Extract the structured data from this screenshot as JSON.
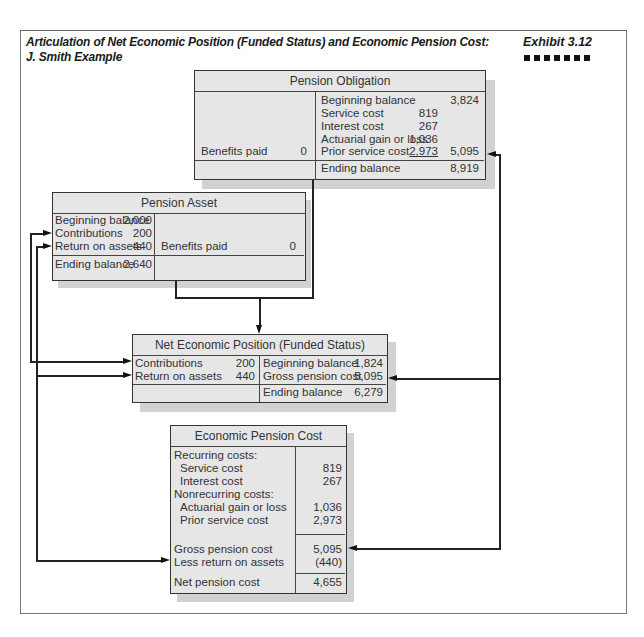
{
  "header": {
    "title_line1": "Articulation of Net Economic Position (Funded Status) and Economic Pension Cost:",
    "title_line2": "J. Smith Example",
    "exhibit": "Exhibit 3.12"
  },
  "pension_obligation": {
    "title": "Pension Obligation",
    "debit": [
      {
        "label": "Benefits paid",
        "value": "0"
      }
    ],
    "credit": [
      {
        "label": "Beginning balance",
        "value": "",
        "total": "3,824"
      },
      {
        "label": "Service cost",
        "value": "819",
        "total": ""
      },
      {
        "label": "Interest cost",
        "value": "267",
        "total": ""
      },
      {
        "label": "Actuarial gain or loss",
        "value": "1,036",
        "total": ""
      },
      {
        "label": "Prior service cost",
        "value": "2,973",
        "total": "5,095"
      }
    ],
    "ending": {
      "label": "Ending balance",
      "value": "8,919"
    }
  },
  "pension_asset": {
    "title": "Pension Asset",
    "debit": [
      {
        "label": "Beginning balance",
        "value": "2,000"
      },
      {
        "label": "Contributions",
        "value": "200"
      },
      {
        "label": "Return on assets",
        "value": "440"
      }
    ],
    "credit": [
      {
        "label": "Benefits paid",
        "value": "0"
      }
    ],
    "ending": {
      "label": "Ending balance",
      "value": "2,640"
    }
  },
  "net_economic_position": {
    "title": "Net Economic Position (Funded Status)",
    "debit": [
      {
        "label": "Contributions",
        "value": "200"
      },
      {
        "label": "Return on assets",
        "value": "440"
      }
    ],
    "credit": [
      {
        "label": "Beginning balance",
        "value": "1,824"
      },
      {
        "label": "Gross pension cost",
        "value": "5,095"
      }
    ],
    "ending": {
      "label": "Ending balance",
      "value": "6,279"
    }
  },
  "economic_pension_cost": {
    "title": "Economic Pension Cost",
    "recurring_heading": "Recurring costs:",
    "recurring": [
      {
        "label": "Service cost",
        "value": "819"
      },
      {
        "label": "Interest cost",
        "value": "267"
      }
    ],
    "nonrecurring_heading": "Nonrecurring costs:",
    "nonrecurring": [
      {
        "label": "Actuarial gain or loss",
        "value": "1,036"
      },
      {
        "label": "Prior service cost",
        "value": "2,973"
      }
    ],
    "gross": {
      "label": "Gross pension cost",
      "value": "5,095"
    },
    "less_return": {
      "label": "Less return on assets",
      "value": "(440)"
    },
    "net": {
      "label": "Net pension cost",
      "value": "4,655"
    }
  }
}
